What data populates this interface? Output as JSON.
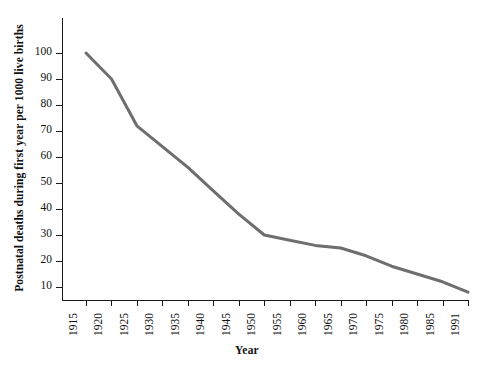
{
  "chart_data": {
    "type": "line",
    "title": "",
    "subtitle": "",
    "xlabel": "Year",
    "ylabel": "Postnatal deaths during first year per 1000 live births",
    "grid": false,
    "legend": "none",
    "x_tick_labels": [
      "1915",
      "1920",
      "1925",
      "1930",
      "1935",
      "1940",
      "1945",
      "1950",
      "1955",
      "1960",
      "1965",
      "1970",
      "1975",
      "1980",
      "1985",
      "1991"
    ],
    "y_tick_labels": [
      "10",
      "20",
      "30",
      "40",
      "50",
      "60",
      "70",
      "80",
      "90",
      "100"
    ],
    "ylim": [
      5,
      108
    ],
    "yticks": [
      10,
      20,
      30,
      40,
      50,
      60,
      70,
      80,
      90,
      100
    ],
    "x": [
      1915,
      1920,
      1925,
      1930,
      1935,
      1940,
      1945,
      1950,
      1955,
      1960,
      1965,
      1970,
      1975,
      1980,
      1985,
      1991
    ],
    "values": [
      100,
      90,
      72,
      64,
      56,
      47,
      38,
      30,
      28,
      26,
      25,
      22,
      18,
      15,
      12,
      8
    ],
    "series": [
      {
        "name": "Postnatal deaths per 1000 live births",
        "color": "#6e6e6e",
        "line_width": 3,
        "values": [
          100,
          90,
          72,
          64,
          56,
          47,
          38,
          30,
          28,
          26,
          25,
          22,
          18,
          15,
          12,
          8
        ]
      }
    ],
    "axis_color": "#1a1a1a",
    "background_color": "#ffffff"
  }
}
